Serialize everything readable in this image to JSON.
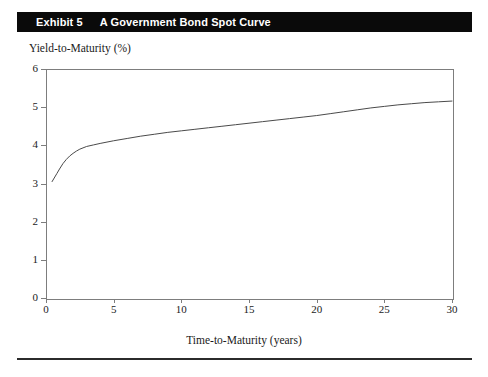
{
  "exhibit": {
    "number_label": "Exhibit 5",
    "title": "A Government Bond Spot Curve"
  },
  "axis": {
    "y_title": "Yield-to-Maturity (%)",
    "x_title": "Time-to-Maturity (years)",
    "y_ticks": [
      "6",
      "5",
      "4",
      "3",
      "2",
      "1",
      "0"
    ],
    "x_ticks": [
      "0",
      "5",
      "10",
      "15",
      "20",
      "25",
      "30"
    ]
  },
  "colors": {
    "banner_background": "#0a0a0a",
    "banner_text": "#ffffff",
    "axis_line": "#7d7d7d",
    "curve_line": "#4a4a4a",
    "rule": "#2b2b2b",
    "text": "#1a1a1a"
  },
  "chart_data": {
    "type": "line",
    "title": "A Government Bond Spot Curve",
    "xlabel": "Time-to-Maturity (years)",
    "ylabel": "Yield-to-Maturity (%)",
    "xlim": [
      0,
      30
    ],
    "ylim": [
      0,
      6
    ],
    "xticks": [
      0,
      5,
      10,
      15,
      20,
      25,
      30
    ],
    "yticks": [
      0,
      1,
      2,
      3,
      4,
      5,
      6
    ],
    "grid": false,
    "legend": "none",
    "series": [
      {
        "name": "Spot curve",
        "x": [
          0.45,
          0.8,
          1.0,
          1.25,
          1.5,
          1.75,
          2.0,
          2.25,
          2.5,
          3.0,
          3.5,
          4.0,
          5.0,
          6.0,
          7.0,
          8.0,
          9.0,
          10.0,
          11.0,
          12.0,
          13.0,
          14.0,
          15.0,
          16.0,
          17.0,
          18.0,
          19.0,
          20.0,
          21.0,
          22.0,
          23.0,
          24.0,
          25.0,
          26.0,
          27.0,
          28.0,
          29.0,
          30.0
        ],
        "y": [
          3.05,
          3.26,
          3.38,
          3.52,
          3.63,
          3.72,
          3.79,
          3.85,
          3.9,
          3.97,
          4.01,
          4.05,
          4.12,
          4.18,
          4.24,
          4.29,
          4.34,
          4.38,
          4.42,
          4.46,
          4.5,
          4.54,
          4.58,
          4.62,
          4.66,
          4.7,
          4.74,
          4.78,
          4.83,
          4.88,
          4.93,
          4.98,
          5.02,
          5.06,
          5.09,
          5.12,
          5.14,
          5.16
        ]
      }
    ]
  }
}
